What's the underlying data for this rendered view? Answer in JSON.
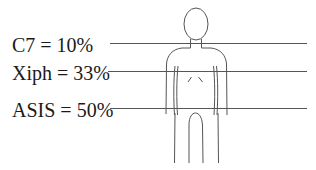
{
  "diagram": {
    "title": "",
    "landmarks": [
      {
        "name": "C7",
        "label": "C7 = 10%",
        "percent": 10
      },
      {
        "name": "Xiph",
        "label": "Xiph = 33%",
        "percent": 33
      },
      {
        "name": "ASIS",
        "label": "ASIS = 50%",
        "percent": 50
      }
    ],
    "figure": "human-body-outline",
    "colors": {
      "line": "#555555",
      "text": "#1a1a1a",
      "background": "#ffffff"
    }
  }
}
